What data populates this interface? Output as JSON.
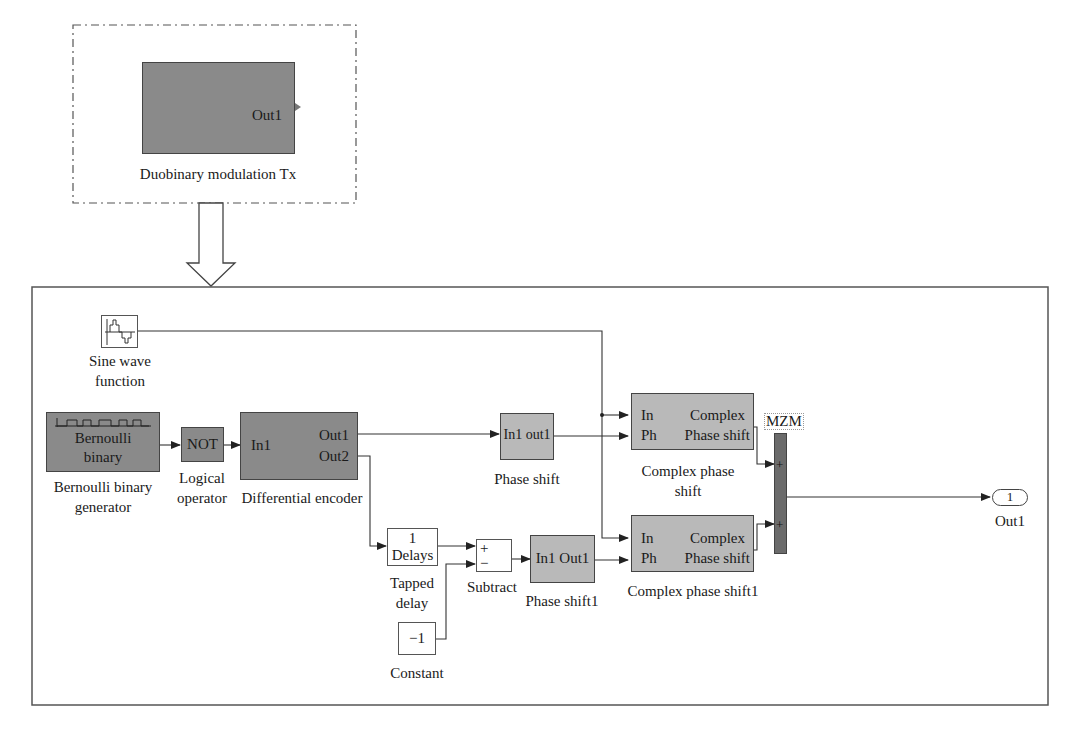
{
  "top": {
    "subsystem": {
      "port_label": "Out1",
      "caption": "Duobinary modulation Tx"
    }
  },
  "main": {
    "sine": {
      "caption_line1": "Sine wave",
      "caption_line2": "function",
      "icon": "sine-wave-icon"
    },
    "bernoulli": {
      "inner_line1": "Bernoulli",
      "inner_line2": "binary",
      "caption_line1": "Bernoulli binary",
      "caption_line2": "generator",
      "icon": "pulse-train-icon"
    },
    "not_gate": {
      "inner": "NOT",
      "caption_line1": "Logical",
      "caption_line2": "operator"
    },
    "diff_encoder": {
      "in1": "In1",
      "out1": "Out1",
      "out2": "Out2",
      "caption": "Differential encoder"
    },
    "phase_shift": {
      "inner": "In1 out1",
      "caption": "Phase shift"
    },
    "tapped_delay": {
      "line1": "1",
      "line2": "Delays",
      "caption_line1": "Tapped",
      "caption_line2": "delay"
    },
    "subtract": {
      "plus": "+",
      "minus": "−",
      "caption": "Subtract"
    },
    "constant": {
      "value": "−1",
      "caption": "Constant"
    },
    "phase_shift1": {
      "inner": "In1 Out1",
      "caption": "Phase shift1"
    },
    "complex_phase_shift": {
      "in": "In",
      "ph": "Ph",
      "right_line1": "Complex",
      "right_line2": "Phase shift",
      "caption_line1": "Complex phase",
      "caption_line2": "shift"
    },
    "complex_phase_shift1": {
      "in": "In",
      "ph": "Ph",
      "right_line1": "Complex",
      "right_line2": "Phase shift",
      "caption": "Complex phase shift1"
    },
    "mzm": {
      "tag": "MZM",
      "sign1": "+",
      "sign2": "+"
    },
    "outport": {
      "number": "1",
      "caption": "Out1"
    }
  },
  "colors": {
    "dark_block": "#8a8a8a",
    "light_block": "#b9b9b9",
    "mzm_bar": "#6b6b6b",
    "line": "#333333"
  }
}
